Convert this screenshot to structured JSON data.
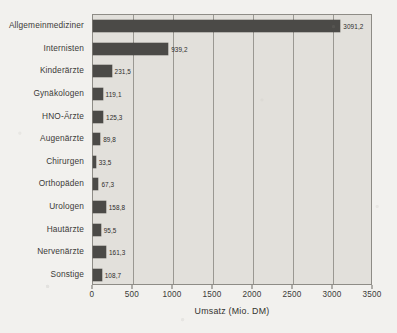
{
  "chart_data": {
    "type": "bar",
    "orientation": "horizontal",
    "title": "",
    "xlabel": "Umsatz (Mio. DM)",
    "ylabel": "",
    "xlim": [
      0,
      3500
    ],
    "grid": true,
    "legend": false,
    "bar_color": "#4b4a47",
    "plot_background": "#e2e0db",
    "decimal_separator": ",",
    "xticks": [
      0,
      500,
      1000,
      1500,
      2000,
      2500,
      3000,
      3500
    ],
    "xtick_labels": [
      "0",
      "500",
      "1000",
      "1500",
      "2000",
      "2500",
      "3000",
      "3500"
    ],
    "categories": [
      "Allgemeinmediziner",
      "Internisten",
      "Kinderärzte",
      "Gynäkologen",
      "HNO-Ärzte",
      "Augenärzte",
      "Chirurgen",
      "Orthopäden",
      "Urologen",
      "Hautärzte",
      "Nervenärzte",
      "Sonstige"
    ],
    "values": [
      3091.2,
      939.2,
      231.5,
      119.1,
      125.3,
      89.8,
      33.5,
      67.3,
      158.8,
      95.5,
      161.3,
      108.7
    ],
    "value_labels": [
      "3091,2",
      "939,2",
      "231,5",
      "119,1",
      "125,3",
      "89,8",
      "33,5",
      "67,3",
      "158,8",
      "95,5",
      "161,3",
      "108,7"
    ]
  }
}
